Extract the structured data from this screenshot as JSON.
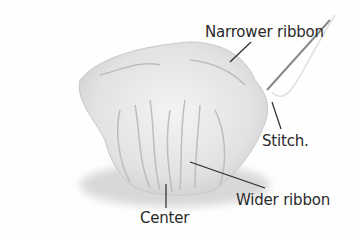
{
  "image": {
    "description": "Gathered satin ribbon rosette with a sewing needle, annotated with labels",
    "background_color": "#fefefe",
    "ribbon_color": "#e6e6e6",
    "line_color": "#2a2a2a"
  },
  "labels": {
    "narrower_ribbon": "Narrower ribbon",
    "stitch": "Stitch.",
    "wider_ribbon": "Wider ribbon",
    "center": "Center"
  }
}
